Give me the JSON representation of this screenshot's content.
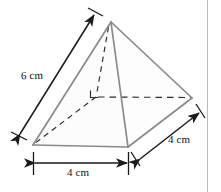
{
  "figure": {
    "shape_name": "square pyramid",
    "unit": "cm",
    "colors": {
      "solid_edge": "#8a8a8a",
      "hidden_edge": "#2b2b2b",
      "dimension_line": "#1a1a1a",
      "base_fill": "#f4f5f6",
      "face_fill": "#fdfdfd",
      "text": "#141414",
      "rule": "#b9b9b9",
      "background": "#ffffff"
    },
    "vertices": {
      "apex": [
        111,
        22
      ],
      "base_front_left": [
        33,
        145
      ],
      "base_front_right": [
        128,
        147
      ],
      "base_back_right": [
        192,
        98
      ],
      "base_back_left_hidden": [
        96,
        97
      ]
    },
    "solid_edges": [
      "apex-base_front_left",
      "apex-base_front_right",
      "apex-base_back_right",
      "base_front_left-base_front_right",
      "base_front_right-base_back_right"
    ],
    "hidden_edges": [
      "base_back_left_hidden-base_front_left",
      "base_back_left_hidden-base_back_right",
      "apex-base_back_left_hidden"
    ],
    "right_angle_marker": {
      "at": "base_back_left_hidden",
      "shown": true
    }
  },
  "dimensions": [
    {
      "id": "slant-height",
      "label": "6 cm",
      "value": 6,
      "unit": "cm",
      "measures": "slant edge from base front-left vertex to apex",
      "arrow_from": [
        19,
        135
      ],
      "arrow_to": [
        95,
        14
      ],
      "arrowheads": "both"
    },
    {
      "id": "base-width",
      "label": "4 cm",
      "value": 4,
      "unit": "cm",
      "measures": "base front edge width",
      "arrow_from": [
        35,
        163
      ],
      "arrow_to": [
        128,
        163
      ],
      "arrowheads": "both"
    },
    {
      "id": "base-depth",
      "label": "4 cm",
      "value": 4,
      "unit": "cm",
      "measures": "base right edge depth",
      "arrow_from": [
        140,
        160
      ],
      "arrow_to": [
        200,
        112
      ],
      "arrowheads": "both"
    }
  ],
  "decor": {
    "right_rule_label": "page-rule"
  }
}
